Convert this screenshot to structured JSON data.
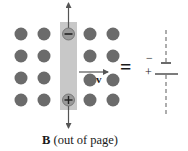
{
  "figure": {
    "caption_symbol": "B",
    "caption_text": " (out of page)",
    "velocity_label": "v",
    "equals": "=",
    "battery_minus": "−",
    "battery_plus": "+",
    "rod_top_charge": "−",
    "rod_bottom_charge": "+"
  },
  "colors": {
    "dot": "#6b6b6b",
    "rod": "#c8c8c8",
    "arrow": "#555555",
    "text": "#1a1a1a"
  },
  "field_dots": {
    "columns_x": [
      21,
      44,
      90,
      113
    ],
    "rows_y": [
      34,
      56,
      78,
      100
    ],
    "radius": 6.5
  }
}
